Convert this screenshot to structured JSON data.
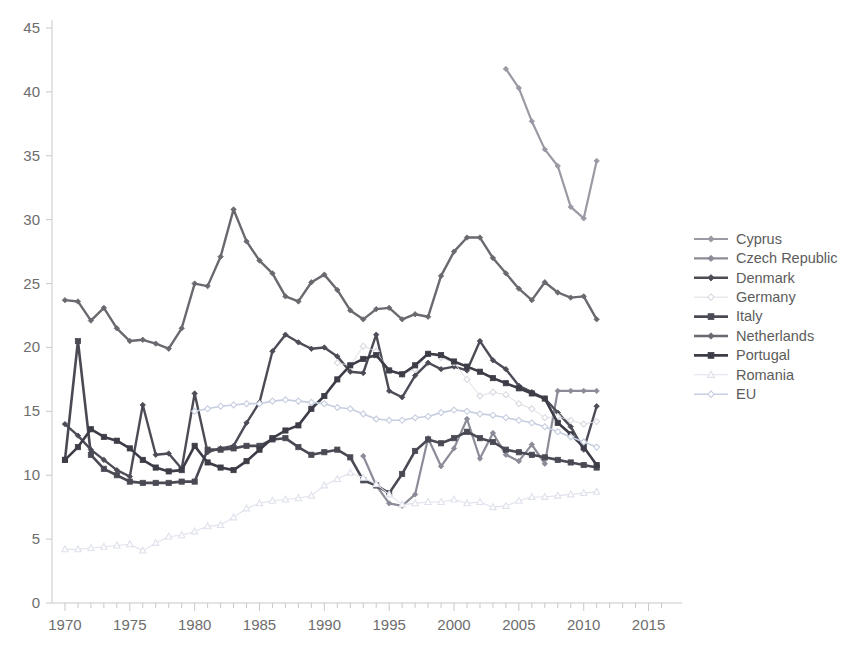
{
  "chart_data": {
    "type": "line",
    "title": "",
    "subtitle": "",
    "xlabel": "",
    "ylabel": "",
    "xlim": [
      1969,
      2016.5
    ],
    "ylim": [
      0,
      45
    ],
    "xticks": [
      1970,
      1975,
      1980,
      1985,
      1990,
      1995,
      2000,
      2005,
      2010,
      2015
    ],
    "yticks": [
      0,
      5,
      10,
      15,
      20,
      25,
      30,
      35,
      40,
      45
    ],
    "xtick_labels": [
      "1970",
      "1975",
      "1980",
      "1985",
      "1990",
      "1995",
      "2000",
      "2005",
      "2010",
      "2015"
    ],
    "ytick_labels": [
      "0",
      "5",
      "10",
      "15",
      "20",
      "25",
      "30",
      "35",
      "40",
      "45"
    ],
    "grid": false,
    "legend_position": "right",
    "series": [
      {
        "name": "Cyprus",
        "color": "#9a9aa5",
        "marker": "diamond",
        "marker_filled": true,
        "line_width": 2.2,
        "x": [
          2004,
          2005,
          2006,
          2007,
          2008,
          2009,
          2010,
          2011
        ],
        "values": [
          41.8,
          40.3,
          37.7,
          35.5,
          34.2,
          31.0,
          30.1,
          34.6
        ]
      },
      {
        "name": "Czech Republic",
        "color": "#8c8c99",
        "marker": "diamond",
        "marker_filled": true,
        "line_width": 2.2,
        "x": [
          1993,
          1994,
          1995,
          1996,
          1997,
          1998,
          1999,
          2000,
          2001,
          2002,
          2003,
          2004,
          2005,
          2006,
          2007,
          2008,
          2009,
          2010,
          2011
        ],
        "values": [
          11.5,
          9.2,
          7.8,
          7.6,
          8.5,
          12.9,
          10.7,
          12.1,
          14.4,
          11.3,
          13.3,
          11.6,
          11.1,
          12.4,
          10.9,
          16.6,
          16.6,
          16.6,
          16.6
        ]
      },
      {
        "name": "Denmark",
        "color": "#4c4c57",
        "marker": "diamond",
        "marker_filled": true,
        "line_width": 2.4,
        "x": [
          1970,
          1971,
          1972,
          1973,
          1974,
          1975,
          1976,
          1977,
          1978,
          1979,
          1980,
          1981,
          1982,
          1983,
          1984,
          1985,
          1986,
          1987,
          1988,
          1989,
          1990,
          1991,
          1992,
          1993,
          1994,
          1995,
          1996,
          1997,
          1998,
          1999,
          2000,
          2001,
          2002,
          2003,
          2004,
          2005,
          2006,
          2007,
          2008,
          2009,
          2010,
          2011
        ],
        "values": [
          14.0,
          13.1,
          12.0,
          11.2,
          10.4,
          9.9,
          15.5,
          11.6,
          11.7,
          10.5,
          16.4,
          11.8,
          12.1,
          12.3,
          14.1,
          15.7,
          19.7,
          21.0,
          20.4,
          19.9,
          20.0,
          19.3,
          18.1,
          18.0,
          21.0,
          16.6,
          16.1,
          17.8,
          18.8,
          18.3,
          18.5,
          18.2,
          20.5,
          19.0,
          18.3,
          17.0,
          16.5,
          16.0,
          14.9,
          13.8,
          12.0,
          15.4
        ]
      },
      {
        "name": "Germany",
        "color": "#d9d9e0",
        "marker": "diamond",
        "marker_filled": false,
        "line_width": 0.9,
        "x": [
          1991,
          1992,
          1993,
          1994,
          1995,
          1996,
          1997,
          1998,
          1999,
          2000,
          2001,
          2002,
          2003,
          2004,
          2005,
          2006,
          2007,
          2008,
          2009,
          2010,
          2011
        ],
        "values": [
          18.8,
          18.6,
          20.1,
          19.7,
          18.2,
          17.9,
          18.3,
          19.5,
          19.2,
          18.8,
          17.5,
          16.2,
          16.5,
          16.3,
          15.6,
          15.2,
          14.5,
          14.6,
          14.3,
          14.0,
          14.2
        ]
      },
      {
        "name": "Italy",
        "color": "#4a4a55",
        "marker": "square",
        "marker_filled": true,
        "line_width": 2.6,
        "x": [
          1970,
          1971,
          1972,
          1973,
          1974,
          1975,
          1976,
          1977,
          1978,
          1979,
          1980,
          1981,
          1982,
          1983,
          1984,
          1985,
          1986,
          1987,
          1988,
          1989,
          1990,
          1991,
          1992,
          1993,
          1994,
          1995,
          1996,
          1997,
          1998,
          1999,
          2000,
          2001,
          2002,
          2003,
          2004,
          2005,
          2006,
          2007,
          2008,
          2009,
          2010,
          2011
        ],
        "values": [
          11.2,
          20.5,
          11.6,
          10.5,
          10.0,
          9.5,
          9.4,
          9.4,
          9.4,
          9.5,
          9.5,
          12.0,
          12.0,
          12.1,
          12.3,
          12.3,
          12.8,
          12.9,
          12.2,
          11.6,
          11.8,
          12.0,
          11.4,
          9.6,
          9.2,
          8.6,
          10.1,
          11.9,
          12.8,
          12.5,
          12.9,
          13.4,
          12.9,
          12.6,
          12.0,
          11.8,
          11.6,
          11.4,
          11.2,
          11.0,
          10.8,
          10.6
        ]
      },
      {
        "name": "Netherlands",
        "color": "#69696f",
        "marker": "diamond",
        "marker_filled": true,
        "line_width": 2.4,
        "x": [
          1970,
          1971,
          1972,
          1973,
          1974,
          1975,
          1976,
          1977,
          1978,
          1979,
          1980,
          1981,
          1982,
          1983,
          1984,
          1985,
          1986,
          1987,
          1988,
          1989,
          1990,
          1991,
          1992,
          1993,
          1994,
          1995,
          1996,
          1997,
          1998,
          1999,
          2000,
          2001,
          2002,
          2003,
          2004,
          2005,
          2006,
          2007,
          2008,
          2009,
          2010,
          2011
        ],
        "values": [
          23.7,
          23.6,
          22.1,
          23.1,
          21.5,
          20.5,
          20.6,
          20.3,
          19.9,
          21.5,
          25.0,
          24.8,
          27.1,
          30.8,
          28.3,
          26.8,
          25.8,
          24.0,
          23.6,
          25.1,
          25.7,
          24.5,
          22.9,
          22.2,
          23.0,
          23.1,
          22.2,
          22.6,
          22.4,
          25.6,
          27.5,
          28.6,
          28.6,
          27.0,
          25.8,
          24.6,
          23.7,
          25.1,
          24.3,
          23.9,
          24.0,
          22.2
        ]
      },
      {
        "name": "Portugal",
        "color": "#3d3d48",
        "marker": "square",
        "marker_filled": true,
        "line_width": 2.6,
        "x": [
          1970,
          1971,
          1972,
          1973,
          1974,
          1975,
          1976,
          1977,
          1978,
          1979,
          1980,
          1981,
          1982,
          1983,
          1984,
          1985,
          1986,
          1987,
          1988,
          1989,
          1990,
          1991,
          1992,
          1993,
          1994,
          1995,
          1996,
          1997,
          1998,
          1999,
          2000,
          2001,
          2002,
          2003,
          2004,
          2005,
          2006,
          2007,
          2008,
          2009,
          2010,
          2011
        ],
        "values": [
          11.2,
          12.2,
          13.6,
          13.0,
          12.7,
          12.1,
          11.2,
          10.6,
          10.3,
          10.4,
          12.3,
          11.0,
          10.6,
          10.4,
          11.1,
          12.0,
          12.9,
          13.5,
          13.9,
          15.2,
          16.2,
          17.5,
          18.6,
          19.1,
          19.4,
          18.2,
          17.9,
          18.6,
          19.5,
          19.4,
          18.9,
          18.5,
          18.1,
          17.6,
          17.2,
          16.8,
          16.4,
          16.0,
          14.1,
          13.2,
          12.2,
          10.8
        ]
      },
      {
        "name": "Romania",
        "color": "#dfe2ec",
        "marker": "triangle",
        "marker_filled": false,
        "line_width": 1.1,
        "x": [
          1970,
          1971,
          1972,
          1973,
          1974,
          1975,
          1976,
          1977,
          1978,
          1979,
          1980,
          1981,
          1982,
          1983,
          1984,
          1985,
          1986,
          1987,
          1988,
          1989,
          1990,
          1991,
          1992,
          1993,
          1994,
          1995,
          1996,
          1997,
          1998,
          1999,
          2000,
          2001,
          2002,
          2003,
          2004,
          2005,
          2006,
          2007,
          2008,
          2009,
          2010,
          2011
        ],
        "values": [
          4.2,
          4.2,
          4.3,
          4.4,
          4.5,
          4.6,
          4.1,
          4.7,
          5.2,
          5.3,
          5.6,
          6.0,
          6.1,
          6.7,
          7.4,
          7.8,
          8.0,
          8.1,
          8.2,
          8.4,
          9.2,
          9.7,
          10.2,
          9.8,
          9.3,
          8.5,
          7.7,
          7.8,
          7.9,
          7.9,
          8.1,
          7.8,
          7.9,
          7.5,
          7.6,
          8.0,
          8.3,
          8.3,
          8.4,
          8.5,
          8.6,
          8.7
        ]
      },
      {
        "name": "EU",
        "color": "#c6cee0",
        "marker": "diamond",
        "marker_filled": false,
        "line_width": 1.6,
        "x": [
          1980,
          1981,
          1982,
          1983,
          1984,
          1985,
          1986,
          1987,
          1988,
          1989,
          1990,
          1991,
          1992,
          1993,
          1994,
          1995,
          1996,
          1997,
          1998,
          1999,
          2000,
          2001,
          2002,
          2003,
          2004,
          2005,
          2006,
          2007,
          2008,
          2009,
          2010,
          2011
        ],
        "values": [
          15.0,
          15.2,
          15.4,
          15.5,
          15.6,
          15.6,
          15.8,
          15.9,
          15.8,
          15.7,
          15.6,
          15.3,
          15.2,
          14.8,
          14.4,
          14.3,
          14.3,
          14.5,
          14.6,
          14.9,
          15.1,
          15.0,
          14.8,
          14.7,
          14.5,
          14.3,
          14.1,
          13.8,
          13.4,
          13.0,
          12.6,
          12.2
        ]
      }
    ]
  },
  "legend": {
    "items": [
      {
        "label": "Cyprus"
      },
      {
        "label": "Czech Republic"
      },
      {
        "label": "Denmark"
      },
      {
        "label": "Germany"
      },
      {
        "label": "Italy"
      },
      {
        "label": "Netherlands"
      },
      {
        "label": "Portugal"
      },
      {
        "label": "Romania"
      },
      {
        "label": "EU"
      }
    ]
  },
  "axes": {
    "y_axis_name": "y-axis",
    "x_axis_name": "x-axis"
  }
}
